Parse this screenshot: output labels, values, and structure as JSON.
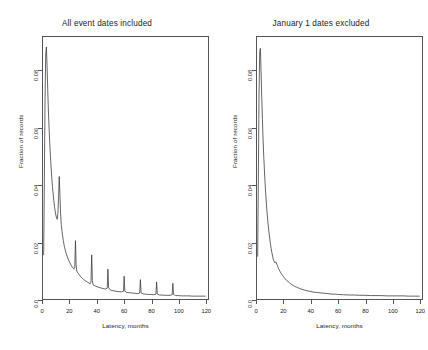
{
  "figure": {
    "background": "#ffffff",
    "line_color": "#3c3c3c",
    "axis_color": "#555555"
  },
  "panels": [
    {
      "id": "all-event-dates",
      "title": "All event dates included",
      "xlabel": "Latency, months",
      "ylabel": "Fraction of records",
      "xticks": [
        "0",
        "20",
        "40",
        "60",
        "80",
        "100",
        "120"
      ],
      "yticks": [
        "0.0",
        "0.02",
        "0.04",
        "0.06",
        "0.08"
      ]
    },
    {
      "id": "january-excluded",
      "title": "January 1 dates excluded",
      "xlabel": "Latency, months",
      "ylabel": "Fraction of records",
      "xticks": [
        "0",
        "20",
        "40",
        "60",
        "80",
        "100",
        "120"
      ],
      "yticks": [
        "0.0",
        "0.02",
        "0.04",
        "0.06",
        "0.08"
      ]
    }
  ],
  "chart_data": [
    {
      "type": "line",
      "panel": "All event dates included",
      "title": "All event dates included",
      "xlabel": "Latency, months",
      "ylabel": "Fraction of records",
      "xlim": [
        0,
        122
      ],
      "ylim": [
        0,
        0.092
      ],
      "xticks": [
        0,
        20,
        40,
        60,
        80,
        100,
        120
      ],
      "yticks": [
        0.0,
        0.02,
        0.04,
        0.06,
        0.08
      ],
      "grid": false,
      "legend": "none",
      "notes": "Density of record latency in months; sharp spike near 0 plus periodic annual spikes at 12-month multiples caused by January 1 default dates.",
      "x": [
        0.5,
        1,
        1.5,
        2,
        2.5,
        3,
        3.5,
        4,
        4.5,
        5,
        5.5,
        6,
        6.5,
        7,
        7.5,
        8,
        8.5,
        9,
        9.5,
        10,
        10.5,
        11,
        11.5,
        12,
        12.5,
        13,
        13.5,
        14,
        14.5,
        15,
        15.5,
        16,
        17,
        18,
        19,
        20,
        21,
        22,
        23,
        23.5,
        24,
        24.5,
        25,
        26,
        27,
        28,
        29,
        30,
        31,
        32,
        33,
        34,
        35,
        35.5,
        36,
        36.5,
        37,
        38,
        40,
        42,
        44,
        46,
        47.5,
        48,
        48.5,
        50,
        52,
        54,
        56,
        58,
        59.5,
        60,
        60.5,
        62,
        64,
        66,
        68,
        70,
        71.5,
        72,
        72.5,
        74,
        76,
        78,
        80,
        82,
        83.5,
        84,
        84.5,
        86,
        88,
        90,
        92,
        94,
        95.5,
        96,
        96.5,
        98,
        100,
        102,
        104,
        106,
        108,
        110,
        112,
        114,
        116,
        118,
        120
      ],
      "y": [
        0.0155,
        0.041,
        0.07,
        0.086,
        0.0885,
        0.082,
        0.0735,
        0.066,
        0.06,
        0.0545,
        0.05,
        0.046,
        0.0425,
        0.0395,
        0.0368,
        0.0345,
        0.0325,
        0.0308,
        0.0295,
        0.0285,
        0.028,
        0.03,
        0.0355,
        0.043,
        0.037,
        0.03,
        0.0262,
        0.024,
        0.0222,
        0.0206,
        0.0192,
        0.018,
        0.0162,
        0.0148,
        0.0136,
        0.0126,
        0.0117,
        0.011,
        0.0106,
        0.0112,
        0.0205,
        0.012,
        0.0098,
        0.009,
        0.0084,
        0.0078,
        0.0073,
        0.0069,
        0.0065,
        0.0062,
        0.0059,
        0.0056,
        0.0054,
        0.006,
        0.0155,
        0.0065,
        0.005,
        0.0047,
        0.0043,
        0.004,
        0.0037,
        0.0035,
        0.0038,
        0.0105,
        0.004,
        0.0031,
        0.0029,
        0.0027,
        0.0026,
        0.0025,
        0.0027,
        0.008,
        0.0028,
        0.0023,
        0.0022,
        0.0021,
        0.002,
        0.0019,
        0.0021,
        0.0068,
        0.0022,
        0.0018,
        0.0017,
        0.0016,
        0.0016,
        0.0015,
        0.0017,
        0.006,
        0.0018,
        0.0014,
        0.0014,
        0.0013,
        0.0013,
        0.0013,
        0.0015,
        0.0055,
        0.0016,
        0.0012,
        0.0012,
        0.0011,
        0.0011,
        0.0011,
        0.0011,
        0.001,
        0.001,
        0.001,
        0.001,
        0.001,
        0.001
      ]
    },
    {
      "type": "line",
      "panel": "January 1 dates excluded",
      "title": "January 1 dates excluded",
      "xlabel": "Latency, months",
      "ylabel": "Fraction of records",
      "xlim": [
        0,
        122
      ],
      "ylim": [
        0,
        0.092
      ],
      "xticks": [
        0,
        20,
        40,
        60,
        80,
        100,
        120
      ],
      "yticks": [
        0.0,
        0.02,
        0.04,
        0.06,
        0.08
      ],
      "grid": false,
      "legend": "none",
      "notes": "Same latency density after removing January 1 event dates; smooth exponential decay with the annual spikes removed.",
      "x": [
        0.5,
        1,
        1.5,
        2,
        2.5,
        3,
        3.5,
        4,
        4.5,
        5,
        5.5,
        6,
        6.5,
        7,
        7.5,
        8,
        8.5,
        9,
        9.5,
        10,
        10.5,
        11,
        11.5,
        12,
        13,
        14,
        15,
        16,
        17,
        18,
        19,
        20,
        21,
        22,
        23,
        24,
        25,
        26,
        27,
        28,
        29,
        30,
        32,
        34,
        36,
        38,
        40,
        42,
        44,
        46,
        48,
        50,
        52,
        54,
        56,
        58,
        60,
        64,
        68,
        72,
        76,
        80,
        84,
        88,
        92,
        96,
        100,
        104,
        108,
        112,
        116,
        120
      ],
      "y": [
        0.015,
        0.042,
        0.072,
        0.0868,
        0.088,
        0.08,
        0.071,
        0.063,
        0.056,
        0.05,
        0.045,
        0.0405,
        0.0365,
        0.033,
        0.03,
        0.0273,
        0.0249,
        0.0228,
        0.0209,
        0.0192,
        0.0177,
        0.0163,
        0.0151,
        0.014,
        0.0128,
        0.013,
        0.0118,
        0.0106,
        0.0097,
        0.0089,
        0.0082,
        0.0076,
        0.007,
        0.0065,
        0.0061,
        0.0057,
        0.0053,
        0.005,
        0.0047,
        0.0044,
        0.0042,
        0.004,
        0.0036,
        0.0033,
        0.003,
        0.0028,
        0.0026,
        0.0024,
        0.0023,
        0.0022,
        0.0021,
        0.002,
        0.0019,
        0.0018,
        0.0017,
        0.0017,
        0.0016,
        0.0015,
        0.0014,
        0.0014,
        0.0013,
        0.0013,
        0.0012,
        0.0012,
        0.0012,
        0.0011,
        0.0011,
        0.0011,
        0.0011,
        0.001,
        0.001,
        0.001
      ]
    }
  ]
}
